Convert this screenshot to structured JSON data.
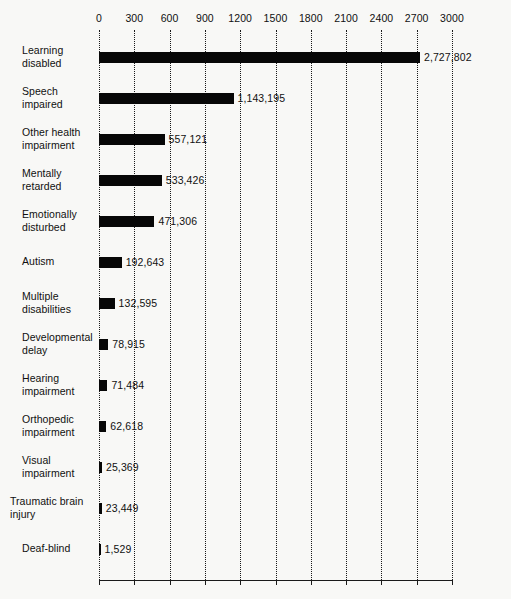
{
  "chart_data": {
    "type": "bar",
    "orientation": "horizontal",
    "title": "",
    "subtitle": "",
    "xlabel": "",
    "ylabel": "",
    "xlim": [
      0,
      3000
    ],
    "grid": true,
    "legend": "none",
    "units_note": "axis values in thousands",
    "categories": [
      "Learning disabled",
      "Speech impaired",
      "Other health impairment",
      "Mentally retarded",
      "Emotionally disturbed",
      "Autism",
      "Multiple disabilities",
      "Developmental delay",
      "Hearing impairment",
      "Orthopedic impairment",
      "Visual impairment",
      "Traumatic brain injury",
      "Deaf-blind"
    ],
    "values": [
      2727802,
      1143195,
      557121,
      533426,
      471306,
      192643,
      132595,
      78915,
      71484,
      62618,
      25369,
      23449,
      1529
    ],
    "value_labels": [
      "2,727,802",
      "1,143,195",
      "557,121",
      "533,426",
      "471,306",
      "192,643",
      "132,595",
      "78,915",
      "71,484",
      "62,618",
      "25,369",
      "23,449",
      "1,529"
    ],
    "xticks": [
      0,
      300,
      600,
      900,
      1200,
      1500,
      1800,
      2100,
      2400,
      2700,
      3000
    ],
    "xtick_labels": [
      "0",
      "300",
      "600",
      "900",
      "1200",
      "1500",
      "1800",
      "2100",
      "2400",
      "2700",
      "3000"
    ],
    "colors": {
      "bar": "#070707",
      "grid": "#1a1a1a",
      "axis": "#1a1a1a",
      "text": "#101010",
      "background": "#f8f8f6"
    }
  },
  "category_lines": [
    [
      "Learning",
      "disabled"
    ],
    [
      "Speech",
      "impaired"
    ],
    [
      "Other health",
      "impairment"
    ],
    [
      "Mentally",
      "retarded"
    ],
    [
      "Emotionally",
      "disturbed"
    ],
    [
      "Autism"
    ],
    [
      "Multiple",
      "disabilities"
    ],
    [
      "Developmental",
      "delay"
    ],
    [
      "Hearing",
      "impairment"
    ],
    [
      "Orthopedic",
      "impairment"
    ],
    [
      "Visual",
      "impairment"
    ],
    [
      "Traumatic brain",
      "injury"
    ],
    [
      "Deaf-blind"
    ]
  ]
}
